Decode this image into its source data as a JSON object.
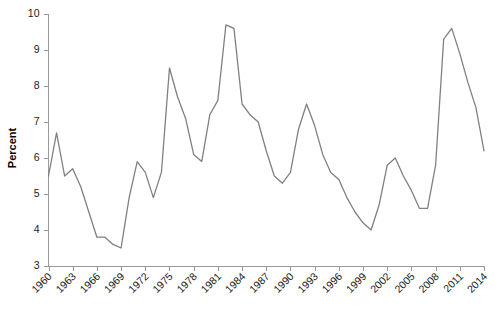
{
  "chart_data": {
    "type": "line",
    "title": "",
    "subtitle": "",
    "xlabel": "",
    "ylabel": "Percent",
    "xlim": [
      1960,
      2014
    ],
    "ylim": [
      3,
      10
    ],
    "grid": false,
    "legend": "none",
    "line_color": "#808080",
    "axis_color": "#999999",
    "text_color": "#1a1a1a",
    "ytick_labels": [
      "3",
      "4",
      "5",
      "6",
      "7",
      "8",
      "9",
      "10"
    ],
    "ytick_values": [
      3,
      4,
      5,
      6,
      7,
      8,
      9,
      10
    ],
    "xtick_labels": [
      "1960",
      "1963",
      "1966",
      "1969",
      "1972",
      "1975",
      "1978",
      "1981",
      "1984",
      "1987",
      "1990",
      "1993",
      "1996",
      "1999",
      "2002",
      "2005",
      "2008",
      "2011",
      "2014"
    ],
    "xtick_values": [
      1960,
      1963,
      1966,
      1969,
      1972,
      1975,
      1978,
      1981,
      1984,
      1987,
      1990,
      1993,
      1996,
      1999,
      2002,
      2005,
      2008,
      2011,
      2014
    ],
    "x": [
      1960,
      1961,
      1962,
      1963,
      1964,
      1965,
      1966,
      1967,
      1968,
      1969,
      1970,
      1971,
      1972,
      1973,
      1974,
      1975,
      1976,
      1977,
      1978,
      1979,
      1980,
      1981,
      1982,
      1983,
      1984,
      1985,
      1986,
      1987,
      1988,
      1989,
      1990,
      1991,
      1992,
      1993,
      1994,
      1995,
      1996,
      1997,
      1998,
      1999,
      2000,
      2001,
      2002,
      2003,
      2004,
      2005,
      2006,
      2007,
      2008,
      2009,
      2010,
      2011,
      2012,
      2013,
      2014
    ],
    "values": [
      5.5,
      6.7,
      5.5,
      5.7,
      5.2,
      4.5,
      3.8,
      3.8,
      3.6,
      3.5,
      4.9,
      5.9,
      5.6,
      4.9,
      5.6,
      8.5,
      7.7,
      7.1,
      6.1,
      5.9,
      7.2,
      7.6,
      9.7,
      9.6,
      7.5,
      7.2,
      7.0,
      6.2,
      5.5,
      5.3,
      5.6,
      6.8,
      7.5,
      6.9,
      6.1,
      5.6,
      5.4,
      4.9,
      4.5,
      4.2,
      4.0,
      4.7,
      5.8,
      6.0,
      5.5,
      5.1,
      4.6,
      4.6,
      5.8,
      9.3,
      9.6,
      8.9,
      8.1,
      7.4,
      6.2
    ],
    "series": [
      {
        "name": "Percent",
        "values": [
          5.5,
          6.7,
          5.5,
          5.7,
          5.2,
          4.5,
          3.8,
          3.8,
          3.6,
          3.5,
          4.9,
          5.9,
          5.6,
          4.9,
          5.6,
          8.5,
          7.7,
          7.1,
          6.1,
          5.9,
          7.2,
          7.6,
          9.7,
          9.6,
          7.5,
          7.2,
          7.0,
          6.2,
          5.5,
          5.3,
          5.6,
          6.8,
          7.5,
          6.9,
          6.1,
          5.6,
          5.4,
          4.9,
          4.5,
          4.2,
          4.0,
          4.7,
          5.8,
          6.0,
          5.5,
          5.1,
          4.6,
          4.6,
          5.8,
          9.3,
          9.6,
          8.9,
          8.1,
          7.4,
          6.2
        ]
      }
    ]
  }
}
